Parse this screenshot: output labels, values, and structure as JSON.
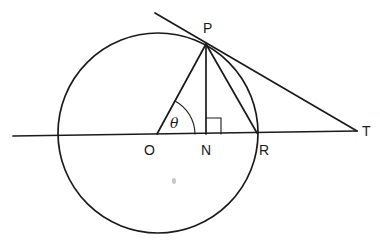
{
  "diagram": {
    "points": {
      "O": {
        "label": "O",
        "x": 157,
        "y": 135
      },
      "N": {
        "label": "N",
        "x": 206,
        "y": 135
      },
      "R": {
        "label": "R",
        "x": 257,
        "y": 134
      },
      "P": {
        "label": "P",
        "x": 206,
        "y": 43
      },
      "T": {
        "label": "T",
        "x": 357,
        "y": 131
      }
    },
    "circle": {
      "cx": 158,
      "cy": 133,
      "r": 100
    },
    "angle": {
      "label": "θ",
      "vertex": "O",
      "between": [
        "OP",
        "ON"
      ]
    },
    "right_angle_marker": {
      "at": "N"
    },
    "segments": [
      "OP",
      "PN",
      "PR",
      "PT",
      "horizontal line through O, N, R, T"
    ],
    "colors": {
      "ink": "#1a1a1a",
      "background": "#ffffff"
    }
  }
}
